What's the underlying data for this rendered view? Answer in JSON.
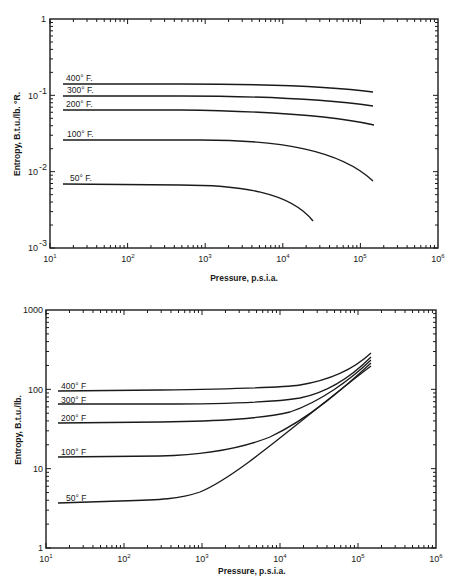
{
  "chart_data": [
    {
      "type": "line",
      "title": "",
      "xlabel": "Pressure, p.s.i.a.",
      "ylabel": "Entropy, B.t.u./lb. °R.",
      "xscale": "log",
      "yscale": "log",
      "xlim": [
        10,
        1000000
      ],
      "ylim": [
        0.001,
        1
      ],
      "grid": false,
      "legend": "inline labels",
      "x_ticks": [
        "10¹",
        "10²",
        "10³",
        "10⁴",
        "10⁵",
        "10⁶"
      ],
      "y_ticks": [
        "10⁻³",
        "10⁻²",
        "10⁻¹",
        "1"
      ],
      "series": [
        {
          "name": "400° F.",
          "x": [
            15,
            100,
            1000,
            10000,
            50000,
            150000
          ],
          "y": [
            0.14,
            0.14,
            0.138,
            0.132,
            0.122,
            0.11
          ]
        },
        {
          "name": "300° F.",
          "x": [
            15,
            100,
            1000,
            10000,
            50000,
            150000
          ],
          "y": [
            0.098,
            0.098,
            0.096,
            0.09,
            0.08,
            0.07
          ]
        },
        {
          "name": "200° F.",
          "x": [
            15,
            100,
            1000,
            10000,
            50000,
            150000
          ],
          "y": [
            0.064,
            0.064,
            0.062,
            0.056,
            0.048,
            0.04
          ]
        },
        {
          "name": "100° F.",
          "x": [
            15,
            100,
            1000,
            10000,
            50000,
            100000,
            150000
          ],
          "y": [
            0.026,
            0.026,
            0.025,
            0.022,
            0.016,
            0.011,
            0.0078
          ]
        },
        {
          "name": "50° F.",
          "x": [
            15,
            100,
            1000,
            5000,
            10000,
            20000,
            25000
          ],
          "y": [
            0.0069,
            0.0069,
            0.0067,
            0.0062,
            0.0052,
            0.0032,
            0.0023
          ]
        }
      ],
      "labels": {
        "x_axis": "Pressure, p.s.i.a.",
        "y_axis": "Entropy, B.t.u./lb. °R.",
        "curves": [
          "400° F.",
          "300° F.",
          "200° F.",
          "100° F.",
          "50° F."
        ]
      }
    },
    {
      "type": "line",
      "title": "",
      "xlabel": "Pressure, p.s.i.a.",
      "ylabel": "Entropy, B.t.u./lb.",
      "xscale": "log",
      "yscale": "log",
      "xlim": [
        10,
        1000000
      ],
      "ylim": [
        1,
        1000
      ],
      "grid": false,
      "legend": "inline labels",
      "x_ticks": [
        "10¹",
        "10²",
        "10³",
        "10⁴",
        "10⁵",
        "10⁶"
      ],
      "y_ticks": [
        "1",
        "10",
        "100",
        "1000"
      ],
      "series": [
        {
          "name": "400° F.",
          "x": [
            15,
            100,
            1000,
            10000,
            50000,
            150000
          ],
          "y": [
            95,
            97,
            102,
            125,
            190,
            290
          ]
        },
        {
          "name": "300° F.",
          "x": [
            15,
            100,
            1000,
            10000,
            50000,
            150000
          ],
          "y": [
            65,
            66,
            72,
            100,
            170,
            260
          ]
        },
        {
          "name": "200° F.",
          "x": [
            15,
            100,
            1000,
            10000,
            50000,
            150000
          ],
          "y": [
            38,
            39,
            44,
            72,
            150,
            235
          ]
        },
        {
          "name": "100° F.",
          "x": [
            15,
            100,
            1000,
            10000,
            50000,
            150000
          ],
          "y": [
            14,
            14.5,
            17,
            40,
            115,
            210
          ]
        },
        {
          "name": "50° F.",
          "x": [
            15,
            100,
            500,
            1000,
            10000,
            50000,
            150000
          ],
          "y": [
            3.7,
            4,
            4.5,
            6,
            27,
            90,
            195
          ]
        }
      ],
      "labels": {
        "x_axis": "Pressure, p.s.i.a.",
        "y_axis": "Entropy, B.t.u./lb.",
        "curves": [
          "400° F.",
          "300° F.",
          "200° F.",
          "100° F.",
          "50° F."
        ]
      }
    }
  ],
  "top_chart": {
    "y_ticks": [
      "1",
      "10",
      "-1",
      "10",
      "-2",
      "10",
      "-3"
    ],
    "y_tick_labels": [
      {
        "base": "1",
        "exp": ""
      },
      {
        "base": "10",
        "exp": "-1"
      },
      {
        "base": "10",
        "exp": "-2"
      },
      {
        "base": "10",
        "exp": "-3"
      }
    ],
    "x_tick_labels": [
      {
        "base": "10",
        "exp": "1"
      },
      {
        "base": "10",
        "exp": "2"
      },
      {
        "base": "10",
        "exp": "3"
      },
      {
        "base": "10",
        "exp": "4"
      },
      {
        "base": "10",
        "exp": "5"
      },
      {
        "base": "10",
        "exp": "6"
      }
    ],
    "xlabel": "Pressure, p.s.i.a.",
    "ylabel": "Entropy, B.t.u./lb. °R.",
    "curve_labels": [
      "400° F.",
      "300° F.",
      "200° F.",
      "100° F.",
      "50° F."
    ]
  },
  "bottom_chart": {
    "y_tick_labels": [
      "1000",
      "100",
      "10",
      "1"
    ],
    "x_tick_labels": [
      {
        "base": "10",
        "exp": "1"
      },
      {
        "base": "10",
        "exp": "2"
      },
      {
        "base": "10",
        "exp": "3"
      },
      {
        "base": "10",
        "exp": "4"
      },
      {
        "base": "10",
        "exp": "5"
      },
      {
        "base": "10",
        "exp": "6"
      }
    ],
    "xlabel": "Pressure, p.s.i.a.",
    "ylabel": "Entropy, B.t.u./lb.",
    "curve_labels": [
      "400° F",
      "300° F",
      "200° F",
      "100° F",
      "50° F"
    ]
  }
}
